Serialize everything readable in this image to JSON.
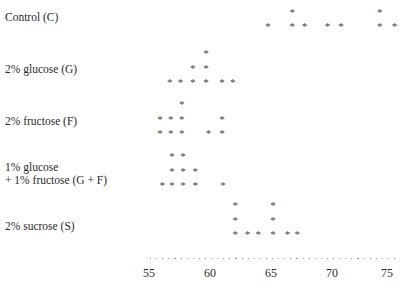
{
  "chart_data": {
    "type": "scatter",
    "subtype": "dot-plot",
    "title": "",
    "xlabel": "",
    "ylabel": "",
    "xlim": [
      54.5,
      76.5
    ],
    "x_ticks": [
      55,
      60,
      65,
      70,
      75
    ],
    "grid": false,
    "legend": null,
    "groups": [
      {
        "name": "Control (C)",
        "values": [
          64.8,
          66.8,
          66.8,
          67.8,
          69.7,
          70.8,
          74.0,
          74.0,
          75.2
        ]
      },
      {
        "name": "2% glucose (G)",
        "values": [
          56.7,
          57.6,
          58.6,
          58.6,
          59.7,
          59.7,
          59.7,
          61.0,
          61.9
        ]
      },
      {
        "name": "2% fructose (F)",
        "values": [
          55.9,
          55.9,
          56.8,
          56.8,
          57.7,
          57.7,
          57.7,
          59.9,
          61.0,
          61.0
        ]
      },
      {
        "name": "1% glucose + 1% fructose (G + F)",
        "values": [
          56.1,
          56.9,
          56.9,
          56.9,
          57.8,
          57.8,
          57.8,
          58.8,
          58.8,
          61.1
        ]
      },
      {
        "name": "2% sucrose (S)",
        "values": [
          62.1,
          62.1,
          62.1,
          63.1,
          64.0,
          65.2,
          65.2,
          65.2,
          66.4,
          67.2
        ]
      }
    ]
  },
  "labels": {
    "control": "Control (C)",
    "glucose": "2% glucose (G)",
    "fructose": "2% fructose (F)",
    "gf_line1": "1% glucose",
    "gf_line2": "+ 1% fructose (G + F)",
    "sucrose": "2% sucrose (S)"
  },
  "ticks": [
    "55",
    "60",
    "65",
    "70",
    "75"
  ],
  "marker": "*"
}
